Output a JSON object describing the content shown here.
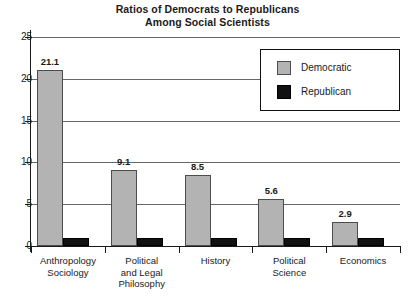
{
  "chart_data": {
    "type": "bar",
    "title": "Ratios of Democrats to Republicans Among Social Scientists",
    "title_lines": [
      "Ratios of Democrats to Republicans",
      "Among Social Scientists"
    ],
    "xlabel": "",
    "ylabel": "",
    "ylim": [
      0,
      25
    ],
    "yticks": [
      0,
      5,
      10,
      15,
      20,
      25
    ],
    "ytick_labels": [
      "0",
      "5",
      "10",
      "15",
      "20",
      "25"
    ],
    "grid": true,
    "legend_position": "top-right",
    "categories": [
      "Anthropology Sociology",
      "Political and Legal Philosophy",
      "History",
      "Political Science",
      "Economics"
    ],
    "category_lines": [
      [
        "Anthropology",
        "Sociology"
      ],
      [
        "Political",
        "and Legal",
        "Philosophy"
      ],
      [
        "History"
      ],
      [
        "Political",
        "Science"
      ],
      [
        "Economics"
      ]
    ],
    "series": [
      {
        "name": "Democratic",
        "color": "#b3b3b3",
        "values": [
          21.1,
          9.1,
          8.5,
          5.6,
          2.9
        ],
        "value_labels": [
          "21.1",
          "9.1",
          "8.5",
          "5.6",
          "2.9"
        ]
      },
      {
        "name": "Republican",
        "color": "#111111",
        "values": [
          1.0,
          1.0,
          1.0,
          1.0,
          1.0
        ],
        "value_labels": [
          "",
          "",
          "",
          "",
          ""
        ]
      }
    ]
  },
  "legend": {
    "entries": [
      {
        "label": "Democratic",
        "color": "#b3b3b3"
      },
      {
        "label": "Republican",
        "color": "#111111"
      }
    ]
  },
  "colors": {
    "democratic": "#b3b3b3",
    "republican": "#111111",
    "gridline": "#666666",
    "axis": "#1a1a1a",
    "background": "#ffffff"
  }
}
